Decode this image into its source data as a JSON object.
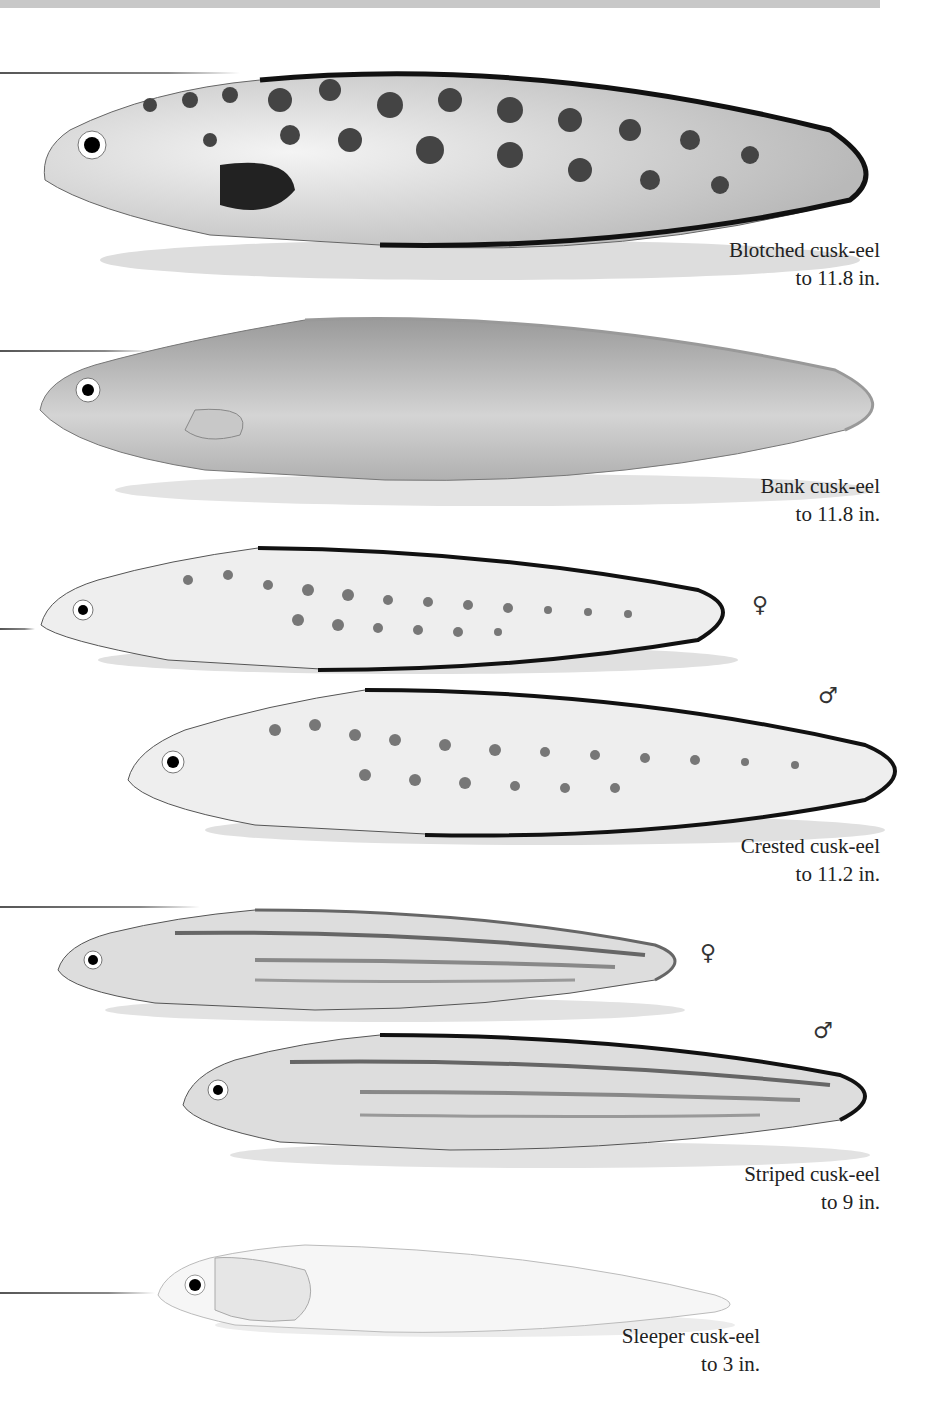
{
  "page": {
    "colors": {
      "background": "#ffffff",
      "top_band": "#c8c8c8",
      "text": "#222222"
    }
  },
  "species": [
    {
      "name": "Blotched cusk-eel",
      "size": "to 11.8 in.",
      "pattern": "large dark blotches",
      "variants": []
    },
    {
      "name": "Bank cusk-eel",
      "size": "to 11.8 in.",
      "pattern": "plain gray",
      "variants": []
    },
    {
      "name": "Crested cusk-eel",
      "size": "to 11.2 in.",
      "pattern": "rows of spots",
      "variants": [
        {
          "symbol": "♀",
          "label": "female"
        },
        {
          "symbol": "♂",
          "label": "male"
        }
      ]
    },
    {
      "name": "Striped cusk-eel",
      "size": "to 9 in.",
      "pattern": "longitudinal stripes",
      "variants": [
        {
          "symbol": "♀",
          "label": "female"
        },
        {
          "symbol": "♂",
          "label": "male"
        }
      ]
    },
    {
      "name": "Sleeper cusk-eel",
      "size": "to 3 in.",
      "pattern": "pale translucent",
      "variants": []
    }
  ]
}
